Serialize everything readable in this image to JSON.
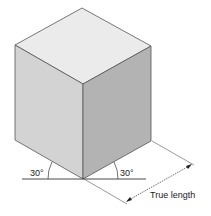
{
  "diagram": {
    "colors": {
      "top_face": "#ebebeb",
      "left_face": "#d3d3d3",
      "right_face": "#b3b3b3",
      "edge": "#555555",
      "line": "#333333"
    },
    "labels": {
      "left_angle": "30°",
      "right_angle": "30°",
      "dimension": "True length"
    }
  }
}
